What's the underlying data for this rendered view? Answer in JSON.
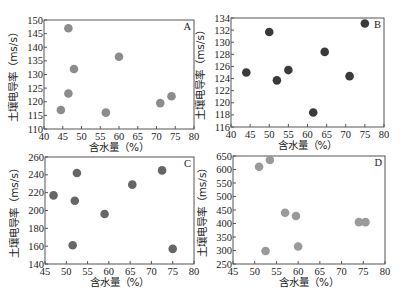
{
  "chart_data": [
    {
      "type": "scatter",
      "panel": "A",
      "xlabel": "含水量（%）",
      "ylabel": "土壤电导率（ms/s）",
      "xlim": [
        40,
        80
      ],
      "ylim": [
        110,
        150
      ],
      "xticks": [
        40,
        45,
        50,
        55,
        60,
        65,
        70,
        75,
        80
      ],
      "yticks": [
        110,
        115,
        120,
        125,
        130,
        135,
        140,
        145,
        150
      ],
      "marker_color": "#8c8c8c",
      "grid": false,
      "points": [
        {
          "x": 46.5,
          "y": 147
        },
        {
          "x": 48,
          "y": 132
        },
        {
          "x": 46.5,
          "y": 123
        },
        {
          "x": 44.5,
          "y": 117
        },
        {
          "x": 60,
          "y": 136.5
        },
        {
          "x": 56.5,
          "y": 116
        },
        {
          "x": 71,
          "y": 119.5
        },
        {
          "x": 74,
          "y": 122
        }
      ]
    },
    {
      "type": "scatter",
      "panel": "B",
      "xlabel": "含水量（%）",
      "ylabel": "土壤电导率（ms/s）",
      "xlim": [
        40,
        80
      ],
      "ylim": [
        116,
        134
      ],
      "xticks": [
        40,
        45,
        50,
        55,
        60,
        65,
        70,
        75,
        80
      ],
      "yticks": [
        116,
        118,
        120,
        122,
        124,
        126,
        128,
        130,
        132,
        134
      ],
      "marker_color": "#3a3a3a",
      "grid": false,
      "points": [
        {
          "x": 44,
          "y": 125
        },
        {
          "x": 50,
          "y": 131.7
        },
        {
          "x": 52,
          "y": 123.7
        },
        {
          "x": 55,
          "y": 125.4
        },
        {
          "x": 61.5,
          "y": 118.4
        },
        {
          "x": 64.5,
          "y": 128.4
        },
        {
          "x": 71,
          "y": 124.4
        },
        {
          "x": 75,
          "y": 133.1
        }
      ]
    },
    {
      "type": "scatter",
      "panel": "C",
      "xlabel": "含水量（%）",
      "ylabel": "土壤电导率（ms/s）",
      "xlim": [
        45,
        80
      ],
      "ylim": [
        140,
        260
      ],
      "xticks": [
        45,
        50,
        55,
        60,
        65,
        70,
        75,
        80
      ],
      "yticks": [
        140,
        160,
        180,
        200,
        220,
        240,
        260
      ],
      "marker_color": "#666666",
      "grid": false,
      "points": [
        {
          "x": 47,
          "y": 217
        },
        {
          "x": 52.5,
          "y": 242
        },
        {
          "x": 52,
          "y": 211
        },
        {
          "x": 51.5,
          "y": 161
        },
        {
          "x": 59,
          "y": 196
        },
        {
          "x": 65.5,
          "y": 229
        },
        {
          "x": 72.5,
          "y": 245
        },
        {
          "x": 75,
          "y": 157
        }
      ]
    },
    {
      "type": "scatter",
      "panel": "D",
      "xlabel": "含水量（%）",
      "ylabel": "土壤电导率（ms/s）",
      "xlim": [
        45,
        80
      ],
      "ylim": [
        250,
        650
      ],
      "xticks": [
        45,
        50,
        55,
        60,
        65,
        70,
        75,
        80
      ],
      "yticks": [
        250,
        300,
        350,
        400,
        450,
        500,
        550,
        600,
        650
      ],
      "marker_color": "#9a9a9a",
      "grid": false,
      "points": [
        {
          "x": 51,
          "y": 610
        },
        {
          "x": 53.5,
          "y": 635
        },
        {
          "x": 52.5,
          "y": 298
        },
        {
          "x": 57,
          "y": 440
        },
        {
          "x": 59.5,
          "y": 428
        },
        {
          "x": 60,
          "y": 315
        },
        {
          "x": 74,
          "y": 405
        },
        {
          "x": 75.5,
          "y": 405
        }
      ]
    }
  ]
}
